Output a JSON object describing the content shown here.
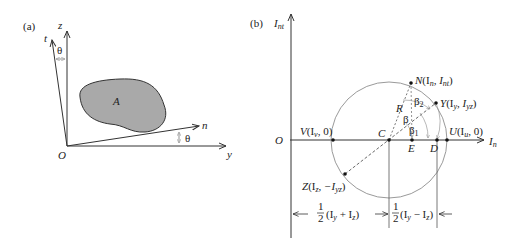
{
  "panel_a": {
    "tag": "(a)",
    "axes": {
      "z": "z",
      "t": "t",
      "n": "n",
      "y": "y",
      "origin": "O"
    },
    "area_label": "A",
    "angle_top": "θ",
    "angle_bottom": "θ",
    "colors": {
      "area_fill": "#a9a9a9",
      "stroke": "#333333"
    }
  },
  "panel_b": {
    "tag": "(b)",
    "y_axis": "I",
    "y_axis_sub": "nt",
    "x_axis": "I",
    "x_axis_sub": "n",
    "origin": "O",
    "points": {
      "N": {
        "name": "N",
        "coord": "(I",
        "s1": "n",
        "mid": ", I",
        "s2": "nt",
        "end": ")"
      },
      "Y": {
        "name": "Y",
        "coord": "(I",
        "s1": "y",
        "mid": ", I",
        "s2": "yz",
        "end": ")"
      },
      "U": {
        "name": "U",
        "coord": "(I",
        "s1": "u",
        "mid": ", 0)"
      },
      "V": {
        "name": "V",
        "coord": "(I",
        "s1": "v",
        "mid": ", 0)"
      },
      "Z": {
        "name": "Z",
        "coord": "(I",
        "s1": "z",
        "mid": ", −I",
        "s2": "yz",
        "end": ")"
      },
      "C": "C",
      "E": "E",
      "D": "D",
      "R": "R"
    },
    "angles": {
      "beta": "β",
      "beta1": "β",
      "beta1_sub": "1",
      "beta2": "β",
      "beta2_sub": "2"
    },
    "dim_left": {
      "frac": "1/2",
      "expr_open": "(I",
      "s1": "y",
      "plus": " + I",
      "s2": "z",
      "close": ")"
    },
    "dim_right": {
      "frac": "1/2",
      "expr_open": "(I",
      "s1": "y",
      "minus": " − I",
      "s2": "z",
      "close": ")"
    },
    "colors": {
      "circle": "#9a9a9a",
      "axis": "#333333",
      "dash": "#444444"
    }
  }
}
